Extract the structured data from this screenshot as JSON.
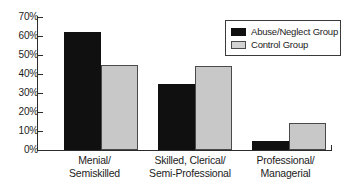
{
  "chart_data": {
    "type": "bar",
    "title": "",
    "xlabel": "",
    "ylabel": "",
    "ylim": [
      0,
      70
    ],
    "ytick_labels": [
      "0%",
      "10%",
      "20%",
      "30%",
      "40%",
      "50%",
      "60%",
      "70%"
    ],
    "ytick_values": [
      0,
      10,
      20,
      30,
      40,
      50,
      60,
      70
    ],
    "grid": false,
    "legend_position": "upper right",
    "categories": [
      "Menial/ Semiskilled",
      "Skilled, Clerical/ Semi-Professional",
      "Professional/ Managerial"
    ],
    "category_lines": [
      [
        "Menial/",
        "Semiskilled"
      ],
      [
        "Skilled, Clerical/",
        "Semi-Professional"
      ],
      [
        "Professional/",
        "Managerial"
      ]
    ],
    "series": [
      {
        "name": "Abuse/Neglect Group",
        "color": "#101010",
        "values": [
          62,
          35,
          5
        ]
      },
      {
        "name": "Control Group",
        "color": "#c8c8c8",
        "values": [
          45,
          44,
          14
        ]
      }
    ]
  },
  "legend": {
    "items": [
      {
        "label": "Abuse/Neglect Group"
      },
      {
        "label": "Control Group"
      }
    ]
  }
}
